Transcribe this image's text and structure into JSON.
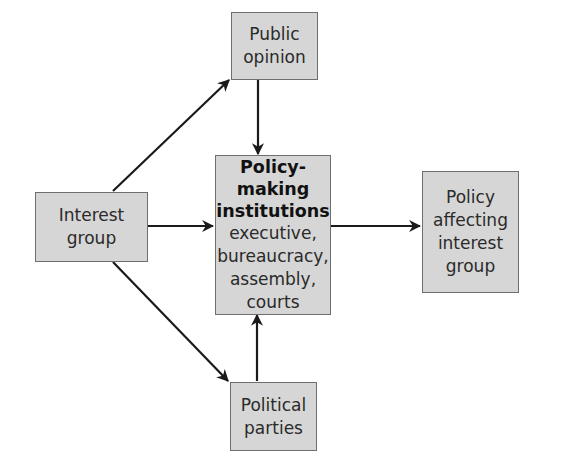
{
  "diagram": {
    "nodes": {
      "public_opinion": {
        "lines": [
          "Public",
          "opinion"
        ]
      },
      "institutions": {
        "title_lines": [
          "Policy-making",
          "institutions"
        ],
        "lines": [
          "executive,",
          "bureaucracy,",
          "assembly,",
          "courts"
        ]
      },
      "interest_group": {
        "lines": [
          "Interest",
          "group"
        ]
      },
      "policy": {
        "lines": [
          "Policy",
          "affecting",
          "interest",
          "group"
        ]
      },
      "political_parties": {
        "lines": [
          "Political",
          "parties"
        ]
      }
    },
    "edges": [
      {
        "from": "Interest group",
        "to": "Public opinion"
      },
      {
        "from": "Interest group",
        "to": "Policy-making institutions"
      },
      {
        "from": "Interest group",
        "to": "Political parties"
      },
      {
        "from": "Public opinion",
        "to": "Policy-making institutions"
      },
      {
        "from": "Political parties",
        "to": "Policy-making institutions"
      },
      {
        "from": "Policy-making institutions",
        "to": "Policy affecting interest group"
      }
    ],
    "colors": {
      "box_fill": "#d6d6d6",
      "box_border": "#6e6e6e",
      "arrow": "#1a1a1a"
    }
  }
}
